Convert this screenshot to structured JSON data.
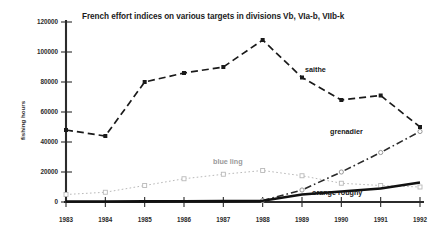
{
  "chart_data": {
    "type": "line",
    "title": "French effort indices on various targets in divisions Vb, VIa-b, VIIb-k",
    "xlabel": "",
    "ylabel": "fishing hours",
    "x": [
      1983,
      1984,
      1985,
      1986,
      1987,
      1988,
      1989,
      1990,
      1991,
      1992
    ],
    "categories": [
      "1983",
      "1984",
      "1985",
      "1986",
      "1987",
      "1988",
      "1989",
      "1990",
      "1991",
      "1992"
    ],
    "xlim": [
      1983,
      1992
    ],
    "ylim": [
      0,
      120000
    ],
    "ytick_values": [
      0,
      20000,
      40000,
      60000,
      80000,
      100000,
      120000
    ],
    "ytick_labels": [
      "0",
      "20000",
      "40000",
      "60000",
      "80000",
      "100000",
      "120000"
    ],
    "grid": false,
    "legend_position": "inline-annotations",
    "series": [
      {
        "name": "saithe",
        "label": "saithe",
        "style": "dashed",
        "marker": "filled-square",
        "color": "#1a1a1a",
        "values": [
          48000,
          44000,
          80000,
          86000,
          90000,
          108000,
          83000,
          68000,
          71000,
          50000
        ]
      },
      {
        "name": "blue ling",
        "label": "blue ling",
        "style": "dotted",
        "marker": "open-square",
        "color": "#b9b9b9",
        "values": [
          5000,
          6500,
          11000,
          15500,
          18500,
          21000,
          17500,
          12500,
          11000,
          10000
        ]
      },
      {
        "name": "grenadier",
        "label": "grenadier",
        "style": "dash-dot",
        "marker": "open-circle",
        "color": "#2a2a2a",
        "values": [
          null,
          null,
          null,
          null,
          null,
          1000,
          8000,
          20000,
          33000,
          47000
        ]
      },
      {
        "name": "orange roughy",
        "label": "orange roughy",
        "style": "solid-thick",
        "marker": "none",
        "color": "#111111",
        "values": [
          300,
          300,
          400,
          500,
          600,
          800,
          5000,
          7000,
          9000,
          13000
        ]
      }
    ]
  },
  "axis": {
    "y_title": "fishing hours"
  }
}
